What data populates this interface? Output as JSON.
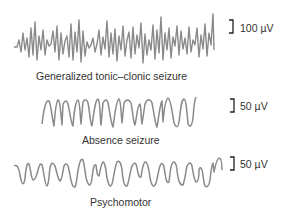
{
  "figure": {
    "traces": [
      {
        "name": "Generalized tonic–clonic seizure",
        "label": "Generalized tonic–clonic seizure",
        "scale_bar": "100 µV",
        "pattern": "high-frequency high-amplitude spikes"
      },
      {
        "name": "Absence seizure",
        "label": "Absence seizure",
        "scale_bar": "50 µV",
        "pattern": "regular spike-and-wave"
      },
      {
        "name": "Psychomotor",
        "label": "Psychomotor",
        "scale_bar": "50 µV",
        "pattern": "rounded slow waves with notches"
      }
    ],
    "colors": {
      "trace": "#8a8a8a",
      "text": "#333333",
      "scale_bar": "#222222"
    }
  }
}
